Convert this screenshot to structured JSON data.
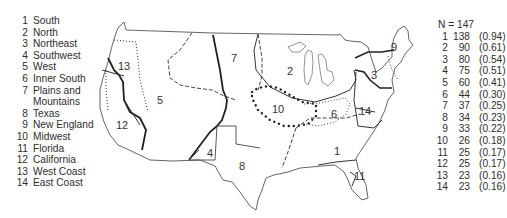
{
  "legend": {
    "items": [
      {
        "num": "1",
        "label": "South"
      },
      {
        "num": "2",
        "label": "North"
      },
      {
        "num": "3",
        "label": "Northeast"
      },
      {
        "num": "4",
        "label": "Southwest"
      },
      {
        "num": "5",
        "label": "West"
      },
      {
        "num": "6",
        "label": "Inner South"
      },
      {
        "num": "7",
        "label": "Plains and"
      },
      {
        "num": "",
        "label": "Mountains"
      },
      {
        "num": "8",
        "label": "Texas"
      },
      {
        "num": "9",
        "label": "New England"
      },
      {
        "num": "10",
        "label": "Midwest"
      },
      {
        "num": "11",
        "label": "Florida"
      },
      {
        "num": "12",
        "label": "California"
      },
      {
        "num": "13",
        "label": "West Coast"
      },
      {
        "num": "14",
        "label": "East Coast"
      }
    ]
  },
  "stats": {
    "header": "N = 147",
    "rows": [
      {
        "rank": "1",
        "count": "138",
        "prop": "(0.94)"
      },
      {
        "rank": "2",
        "count": "90",
        "prop": "(0.61)"
      },
      {
        "rank": "3",
        "count": "80",
        "prop": "(0.54)"
      },
      {
        "rank": "4",
        "count": "75",
        "prop": "(0.51)"
      },
      {
        "rank": "5",
        "count": "60",
        "prop": "(0.41)"
      },
      {
        "rank": "6",
        "count": "44",
        "prop": "(0.30)"
      },
      {
        "rank": "7",
        "count": "37",
        "prop": "(0.25)"
      },
      {
        "rank": "8",
        "count": "34",
        "prop": "(0.23)"
      },
      {
        "rank": "9",
        "count": "33",
        "prop": "(0.22)"
      },
      {
        "rank": "10",
        "count": "26",
        "prop": "(0.18)"
      },
      {
        "rank": "11",
        "count": "25",
        "prop": "(0.17)"
      },
      {
        "rank": "12",
        "count": "25",
        "prop": "(0.17)"
      },
      {
        "rank": "13",
        "count": "23",
        "prop": "(0.16)"
      },
      {
        "rank": "14",
        "count": "23",
        "prop": "(0.16)"
      }
    ]
  },
  "map": {
    "region_labels": [
      {
        "id": "1",
        "text": "1",
        "x": 334,
        "y": 151
      },
      {
        "id": "2",
        "text": "2",
        "x": 287,
        "y": 73
      },
      {
        "id": "3",
        "text": "3",
        "x": 373,
        "y": 76
      },
      {
        "id": "4",
        "text": "4",
        "x": 207,
        "y": 157
      },
      {
        "id": "5",
        "text": "5",
        "x": 157,
        "y": 104
      },
      {
        "id": "6",
        "text": "6",
        "x": 331,
        "y": 118
      },
      {
        "id": "7",
        "text": "7",
        "x": 231,
        "y": 62
      },
      {
        "id": "8",
        "text": "8",
        "x": 239,
        "y": 170
      },
      {
        "id": "9",
        "text": "9",
        "x": 390,
        "y": 50
      },
      {
        "id": "10",
        "text": "10",
        "x": 274,
        "y": 112
      },
      {
        "id": "11",
        "text": "11",
        "x": 354,
        "y": 180
      },
      {
        "id": "12",
        "text": "12",
        "x": 117,
        "y": 129
      },
      {
        "id": "13",
        "text": "13",
        "x": 117,
        "y": 70
      },
      {
        "id": "14",
        "text": "14",
        "x": 360,
        "y": 115
      }
    ],
    "line_color": "#3a3a3a"
  }
}
